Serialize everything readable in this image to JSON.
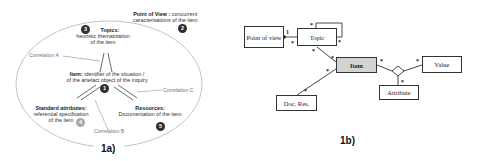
{
  "figure_a": {
    "caption": "1a)",
    "point_of_view": {
      "title": "Point of View :",
      "desc1": "concurrent",
      "desc2": "caracterisations of the item",
      "number": "2"
    },
    "topics": {
      "title": "Topics:",
      "desc1": "heuristic thematization",
      "desc2": "of the item",
      "number": "3"
    },
    "item": {
      "title": "Item:",
      "desc1": "identifier of the situation /",
      "desc2": "of the artefact object of the inquiry",
      "number": "1"
    },
    "standard_attributes": {
      "title": "Standard attributes:",
      "desc1": "referential specification",
      "desc2": "of the item",
      "number": "4"
    },
    "resources": {
      "title": "Resources:",
      "desc1": "Documentation of the item",
      "number": "5"
    },
    "correlations": {
      "a": "Correlation A",
      "b": "Correlation B",
      "c": "Correlation C"
    }
  },
  "figure_b": {
    "caption": "1b)",
    "classes": {
      "point_of_view": "Point of view",
      "topic": "Topic",
      "item": "Item",
      "value": "Value",
      "attribute": "Attribute",
      "doc_res": "Doc. Res."
    },
    "multiplicities": {
      "pov_topic_one": "1",
      "star": "*"
    }
  },
  "colors": {
    "dark_badge": "#2f2f2f",
    "grey_badge": "#a9a9a9",
    "item_fill": "#d3d3d3",
    "ellipse_stroke": "#b0b0b0"
  }
}
